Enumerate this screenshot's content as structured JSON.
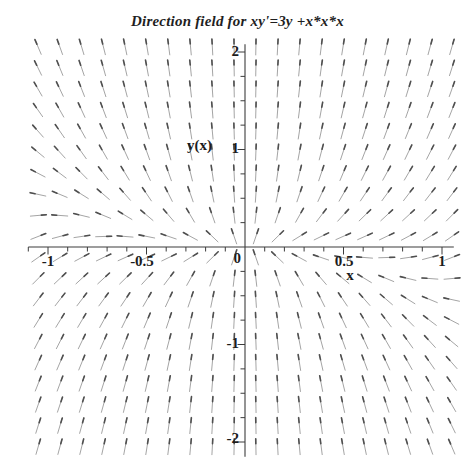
{
  "chart_data": {
    "type": "direction_field",
    "title": "Direction field for xy'=3y +x*x*x",
    "equation": "x*y' = 3y + x*x*x",
    "dy_dx": "3*y/x + x*x",
    "xlabel": "x",
    "ylabel": "y(x)",
    "x_range": [
      -1.05,
      1.05
    ],
    "y_range": [
      -2.05,
      2.05
    ],
    "grid": [
      20,
      20
    ],
    "x_axis": {
      "min": -1.1,
      "max": 1.06,
      "minor_tick_step": 0.1,
      "major_ticks": [
        -1,
        -0.5,
        0.5,
        1
      ],
      "labels": [
        "-1",
        "-0.5",
        "0.5",
        "1"
      ]
    },
    "y_axis": {
      "min": -2.15,
      "max": 2.08,
      "minor_tick_step": 0.25,
      "major_ticks": [
        -2,
        -1,
        1,
        2
      ],
      "labels": [
        "2",
        "1",
        "-1",
        "-2"
      ]
    },
    "origin_label": "0",
    "arrow_color": "#9a9a9a",
    "arrow_head_color": "#4f4f4f",
    "axis_color": "#3c3c3c"
  }
}
